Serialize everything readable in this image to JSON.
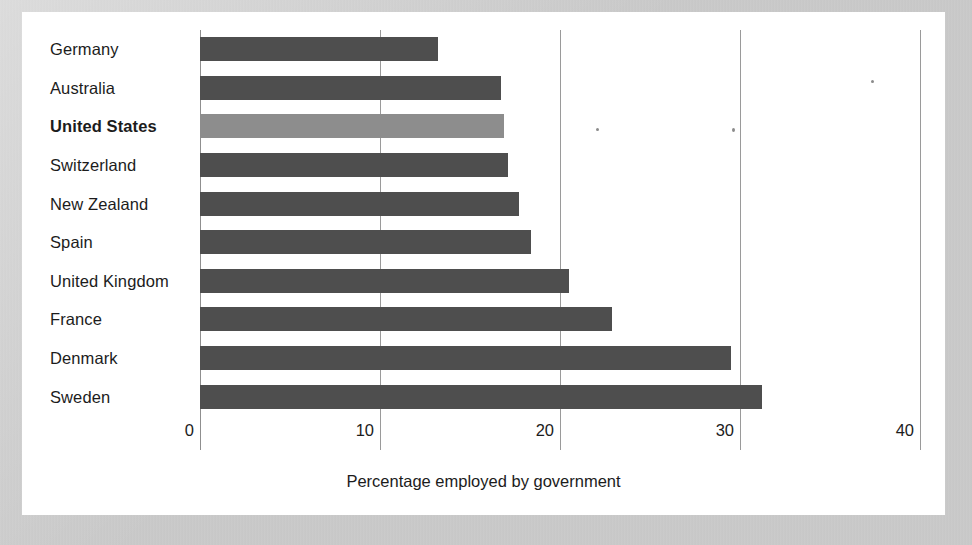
{
  "chart_data": {
    "type": "bar",
    "orientation": "horizontal",
    "title": "",
    "subtitle": "",
    "xlabel": "Percentage employed by government",
    "ylabel": "",
    "xlim": [
      0,
      40
    ],
    "xticks": [
      "0",
      "10",
      "20",
      "30",
      "40"
    ],
    "xtick_values": [
      0,
      10,
      20,
      30,
      40
    ],
    "grid": "vertical",
    "legend": "none",
    "categories": [
      "Germany",
      "Australia",
      "United States",
      "Switzerland",
      "New Zealand",
      "Spain",
      "United Kingdom",
      "France",
      "Denmark",
      "Sweden"
    ],
    "values": [
      13.2,
      16.7,
      16.9,
      17.1,
      17.7,
      18.4,
      20.5,
      22.9,
      29.5,
      31.2
    ],
    "highlight_category": "United States",
    "colors": {
      "bar": "#4e4e4e",
      "bar_highlight": "#8d8d8d",
      "gridline": "#9a9a9a",
      "panel_background": "#ffffff",
      "page_background": "#c8c8c8",
      "text": "#1c1c1c"
    },
    "bars": [
      {
        "label": "Germany",
        "value": 13.2,
        "highlight": false
      },
      {
        "label": "Australia",
        "value": 16.7,
        "highlight": false
      },
      {
        "label": "United States",
        "value": 16.9,
        "highlight": true
      },
      {
        "label": "Switzerland",
        "value": 17.1,
        "highlight": false
      },
      {
        "label": "New Zealand",
        "value": 17.7,
        "highlight": false
      },
      {
        "label": "Spain",
        "value": 18.4,
        "highlight": false
      },
      {
        "label": "United Kingdom",
        "value": 20.5,
        "highlight": false
      },
      {
        "label": "France",
        "value": 22.9,
        "highlight": false
      },
      {
        "label": "Denmark",
        "value": 29.5,
        "highlight": false
      },
      {
        "label": "Sweden",
        "value": 31.2,
        "highlight": false
      }
    ]
  }
}
